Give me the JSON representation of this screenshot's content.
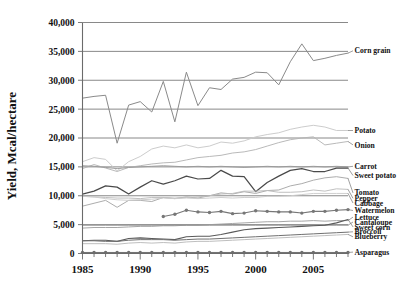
{
  "chart_data": {
    "type": "line",
    "title": "",
    "xlabel": "",
    "ylabel": "Yield, Mcal/hectare",
    "xlim": [
      1985,
      2008
    ],
    "ylim": [
      0,
      40000
    ],
    "ytick_labels": [
      "40,000",
      "35,000",
      "30,000",
      "25,000",
      "20,000",
      "15,000",
      "10,000",
      "5,000",
      "0"
    ],
    "ytick_values": [
      40000,
      35000,
      30000,
      25000,
      20000,
      15000,
      10000,
      5000,
      0
    ],
    "xtick_labels": [
      "1985",
      "1990",
      "1995",
      "2000",
      "2005"
    ],
    "xtick_values": [
      1985,
      1990,
      1995,
      2000,
      2005
    ],
    "grid": true,
    "legend_position": "right-inline-labels",
    "x": [
      1985,
      1986,
      1987,
      1988,
      1989,
      1990,
      1991,
      1992,
      1993,
      1994,
      1995,
      1996,
      1997,
      1998,
      1999,
      2000,
      2001,
      2002,
      2003,
      2004,
      2005,
      2006,
      2007,
      2008
    ],
    "series": [
      {
        "name": "Corn grain",
        "color": "#8a8a8a",
        "label_y": 35100,
        "values": [
          26900,
          27200,
          27400,
          19100,
          25700,
          26300,
          24500,
          29800,
          22800,
          31400,
          25600,
          28700,
          28400,
          30200,
          30500,
          31400,
          31300,
          29200,
          33200,
          36300,
          33400,
          33800,
          34300,
          34700
        ]
      },
      {
        "name": "Potato",
        "color": "#c9c9c9",
        "label_y": 21300,
        "values": [
          15900,
          16600,
          16300,
          14300,
          15900,
          16800,
          18100,
          18600,
          18300,
          18800,
          18300,
          18600,
          19300,
          19100,
          19500,
          20200,
          20600,
          20900,
          21500,
          21900,
          22200,
          21900,
          21300,
          21300
        ]
      },
      {
        "name": "Onion",
        "color": "#b5b5b5",
        "label_y": 18800,
        "values": [
          14700,
          15400,
          14800,
          14200,
          14900,
          15200,
          15500,
          15700,
          15800,
          16200,
          16600,
          16800,
          17000,
          17400,
          17600,
          18000,
          18600,
          19200,
          19700,
          20000,
          20200,
          18800,
          19100,
          19400
        ]
      },
      {
        "name": "Carrot",
        "color": "#9a9a9a",
        "label_y": 15100,
        "values": [
          15200,
          15100,
          14900,
          14700,
          14900,
          15000,
          15100,
          15200,
          15100,
          15000,
          15100,
          15000,
          15100,
          15000,
          14900,
          15000,
          15100,
          15000,
          15100,
          15000,
          15100,
          15000,
          15100,
          15000
        ]
      },
      {
        "name": "Sweet potato",
        "color": "#4a4a4a",
        "label_y": 13500,
        "values": [
          10300,
          10800,
          11700,
          11500,
          10300,
          11500,
          12600,
          12000,
          12600,
          13400,
          12900,
          13000,
          14400,
          13400,
          13300,
          10700,
          12300,
          13400,
          14400,
          14700,
          14200,
          14200,
          14800,
          14800
        ]
      },
      {
        "name": "Tomato",
        "color": "#a8a8a8",
        "label_y": 10500,
        "values": [
          8200,
          8700,
          9200,
          8000,
          9200,
          9200,
          9000,
          9700,
          9500,
          9800,
          9600,
          10000,
          10500,
          10300,
          10700,
          10400,
          10900,
          11000,
          11700,
          12100,
          12700,
          13100,
          13300,
          13000
        ]
      },
      {
        "name": "Pepper",
        "color": "#bdbdbd",
        "label_y": 9550,
        "values": [
          9900,
          9800,
          9700,
          9600,
          9600,
          9500,
          9700,
          9700,
          9600,
          9700,
          9800,
          10000,
          10300,
          10400,
          10800,
          10800,
          10900,
          10600,
          10600,
          10700,
          11000,
          10800,
          11200,
          11100
        ]
      },
      {
        "name": "Cabbage",
        "color": "#cccccc",
        "label_y": 8750,
        "values": [
          9900,
          9800,
          9500,
          9300,
          9200,
          9300,
          9400,
          9600,
          9500,
          9600,
          9500,
          9600,
          9700,
          9600,
          9700,
          9700,
          9900,
          9900,
          10000,
          10200,
          10400,
          10400,
          10400,
          10400
        ]
      },
      {
        "name": "Watermelon",
        "color": "#777777",
        "label_y": 7450,
        "values": [
          null,
          null,
          null,
          null,
          null,
          null,
          null,
          6400,
          6800,
          7500,
          7200,
          7100,
          7300,
          6900,
          7000,
          7400,
          7300,
          7200,
          7200,
          7000,
          7300,
          7300,
          7500,
          7600
        ]
      },
      {
        "name": "Lettuce",
        "color": "#a0a0a0",
        "label_y": 6300,
        "values": [
          4400,
          4500,
          4500,
          4500,
          4600,
          4700,
          4700,
          4800,
          4800,
          4900,
          4900,
          5000,
          5100,
          5200,
          5300,
          5400,
          5500,
          5500,
          5600,
          5600,
          5700,
          5600,
          5700,
          5700
        ]
      },
      {
        "name": "Cantaloupe",
        "color": "#8f8f8f",
        "label_y": 5450,
        "values": [
          4900,
          4900,
          4900,
          4900,
          4900,
          4900,
          4900,
          4900,
          4900,
          4900,
          4900,
          4900,
          4900,
          4900,
          4900,
          4900,
          4900,
          4900,
          4900,
          4900,
          4900,
          4900,
          4900,
          4900
        ]
      },
      {
        "name": "Sweet corn",
        "color": "#5a5a5a",
        "label_y": 4600,
        "values": [
          2200,
          2300,
          2300,
          2100,
          2600,
          2700,
          2600,
          2500,
          2400,
          2900,
          3000,
          3000,
          3300,
          3700,
          4100,
          4300,
          4400,
          4500,
          4600,
          4700,
          4800,
          4900,
          5300,
          5900
        ]
      },
      {
        "name": "Broccoli",
        "color": "#707070",
        "label_y": 3750,
        "values": [
          2200,
          2200,
          2100,
          2100,
          2300,
          2400,
          2400,
          2400,
          2300,
          2400,
          2500,
          2500,
          2600,
          2700,
          2800,
          2900,
          3000,
          3100,
          3200,
          3300,
          3400,
          3500,
          3600,
          3700
        ]
      },
      {
        "name": "Blueberry",
        "color": "#bbbbbb",
        "label_y": 2900,
        "values": [
          1700,
          1700,
          1700,
          1600,
          1800,
          1900,
          1800,
          1900,
          1800,
          2000,
          2100,
          2100,
          2200,
          2300,
          2400,
          2500,
          2600,
          2700,
          2800,
          2900,
          3000,
          3100,
          3200,
          3300
        ]
      },
      {
        "name": "Asparagus",
        "color": "#6e6e6e",
        "label_y": 250,
        "values": [
          180,
          180,
          180,
          180,
          180,
          180,
          180,
          180,
          180,
          180,
          180,
          180,
          180,
          180,
          180,
          180,
          180,
          180,
          180,
          180,
          180,
          180,
          180,
          180
        ]
      }
    ]
  }
}
